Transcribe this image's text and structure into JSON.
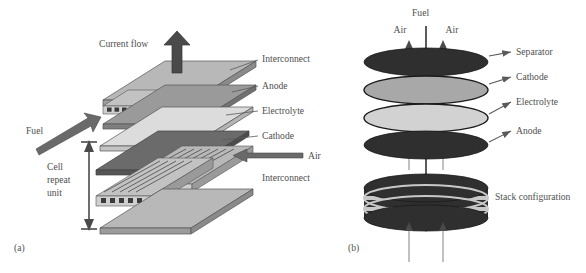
{
  "figure": {
    "background_color": "#ffffff",
    "text_color": "#4f4f4f"
  },
  "panels": [
    {
      "id": "a",
      "letter": "(a)",
      "caption_label": "(a)",
      "type": "planar-exploded-stack",
      "annotations": {
        "current_flow": "Current flow",
        "fuel": "Fuel",
        "air": "Air",
        "cell_repeat_unit_lines": [
          "Cell",
          "repeat",
          "unit"
        ]
      },
      "layer_labels": [
        {
          "name": "interconnect-top",
          "label": "Interconnect",
          "y": 60
        },
        {
          "name": "anode",
          "label": "Anode",
          "y": 87
        },
        {
          "name": "electrolyte",
          "label": "Electrolyte",
          "y": 112
        },
        {
          "name": "cathode",
          "label": "Cathode",
          "y": 137
        },
        {
          "name": "interconnect-bottom",
          "label": "Interconnect",
          "y": 178
        }
      ],
      "layer_colors": {
        "interconnect": "#b8b8b8",
        "interconnect_edge": "#8f8f8f",
        "anode": "#9a9a9a",
        "electrolyte": "#dcdcdc",
        "cathode": "#6b6b6b",
        "arrow": "#5a5a5a"
      }
    },
    {
      "id": "b",
      "letter": "(b)",
      "caption_label": "(b)",
      "type": "tubular-disc-stack",
      "annotations": {
        "fuel": "Fuel",
        "air_left": "Air",
        "air_right": "Air"
      },
      "disc_labels": [
        {
          "name": "separator",
          "label": "Separator",
          "y": 53,
          "color": "#2f2f2f"
        },
        {
          "name": "cathode",
          "label": "Cathode",
          "y": 78,
          "color": "#a8a8a8"
        },
        {
          "name": "electrolyte",
          "label": "Electrolyte",
          "y": 103,
          "color": "#d2d2d2"
        },
        {
          "name": "anode",
          "label": "Anode",
          "y": 132,
          "color": "#2f2f2f"
        },
        {
          "name": "stack-configuration",
          "label": "Stack configuration",
          "y": 196,
          "color": "#2f2f2f"
        }
      ],
      "colors": {
        "dark_disc": "#2f2f2f",
        "mid_disc": "#a8a8a8",
        "light_disc": "#d2d2d2",
        "stack_band_light": "#c8c8c8",
        "arrow": "#6a6a6a",
        "arrow_dark": "#4a4a4a"
      }
    }
  ]
}
